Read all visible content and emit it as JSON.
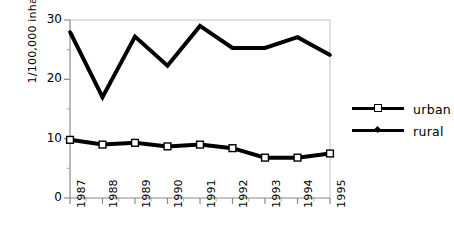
{
  "chart_data": {
    "type": "line",
    "title": "",
    "subtitle": "",
    "xlabel": "",
    "ylabel": "1/100,000 inhabitants",
    "categories": [
      "1987",
      "1988",
      "1989",
      "1990",
      "1991",
      "1992",
      "1993",
      "1994",
      "1995"
    ],
    "x": [
      1987,
      1988,
      1989,
      1990,
      1991,
      1992,
      1993,
      1994,
      1995
    ],
    "series": [
      {
        "name": "urban",
        "marker": "open-square",
        "color": "#000000",
        "values": [
          9.8,
          9.0,
          9.3,
          8.7,
          9.0,
          8.4,
          6.8,
          6.8,
          7.5
        ]
      },
      {
        "name": "rural",
        "marker": "small-diamond",
        "color": "#000000",
        "values": [
          28.0,
          17.0,
          27.2,
          22.3,
          29.0,
          25.3,
          25.3,
          27.1,
          24.1
        ]
      }
    ],
    "ylim": [
      0,
      30
    ],
    "xlim": [
      1987,
      1995
    ],
    "ytick_labels": [
      "0",
      "10",
      "20",
      "30"
    ],
    "ytick_values": [
      0,
      10,
      20,
      30
    ],
    "yminor_tick_values": [
      5,
      15,
      25
    ],
    "grid": false,
    "legend_position": "right",
    "legend_entries": [
      "urban",
      "rural"
    ]
  },
  "axes": {
    "y_title": "1/100,000 inhabitants",
    "y_ticks": [
      "0",
      "10",
      "20",
      "30"
    ],
    "x_ticks": [
      "1987",
      "1988",
      "1989",
      "1990",
      "1991",
      "1992",
      "1993",
      "1994",
      "1995"
    ]
  },
  "legend": {
    "items": [
      {
        "label": "urban"
      },
      {
        "label": "rural"
      }
    ]
  },
  "colors": {
    "series_line": "#000000",
    "axis": "#808080",
    "frame": "#b0b0b0",
    "background": "#ffffff",
    "marker_fill": "#ffffff"
  }
}
